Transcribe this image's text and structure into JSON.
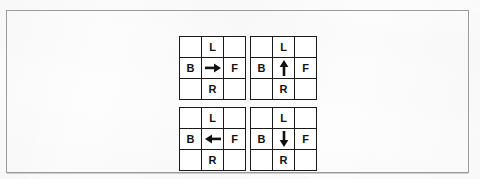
{
  "figure": {
    "frame_color": "#9b9b9b",
    "grid_line_color": "#1a1a1a",
    "background_color": "#fdfdfd",
    "text_color": "#111111"
  },
  "labels": {
    "top": "L",
    "left": "B",
    "right": "F",
    "bottom": "R",
    "blank": ""
  },
  "grids": [
    {
      "id": "grid-top-left",
      "position": "top-left",
      "center_icon": "arrow-right-icon",
      "center_direction": "right",
      "cells": [
        "",
        "L",
        "",
        "B",
        "→",
        "F",
        "",
        "R",
        ""
      ]
    },
    {
      "id": "grid-top-right",
      "position": "top-right",
      "center_icon": "arrow-up-icon",
      "center_direction": "up",
      "cells": [
        "",
        "L",
        "",
        "B",
        "↑",
        "F",
        "",
        "R",
        ""
      ]
    },
    {
      "id": "grid-bottom-left",
      "position": "bottom-left",
      "center_icon": "arrow-left-icon",
      "center_direction": "left",
      "cells": [
        "",
        "L",
        "",
        "B",
        "←",
        "F",
        "",
        "R",
        ""
      ]
    },
    {
      "id": "grid-bottom-right",
      "position": "bottom-right",
      "center_icon": "arrow-down-icon",
      "center_direction": "down",
      "cells": [
        "",
        "L",
        "",
        "B",
        "↓",
        "F",
        "",
        "R",
        ""
      ]
    }
  ]
}
